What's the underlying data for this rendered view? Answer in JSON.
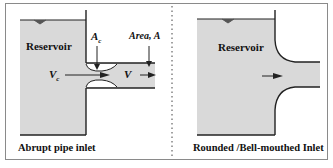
{
  "left_panel": {
    "reservoir_label": "Reservoir",
    "contraction_area_label": "A",
    "contraction_area_sub": "c",
    "pipe_area_label": "Area, A",
    "contraction_velocity_label": "V",
    "contraction_velocity_sub": "c",
    "pipe_velocity_label": "V",
    "caption": "Abrupt pipe inlet"
  },
  "right_panel": {
    "reservoir_label": "Reservoir",
    "caption": "Rounded /Bell-mouthed Inlet"
  },
  "colors": {
    "fluid": "#d9d9d9",
    "wall": "#222222",
    "border": "#8a8a8a"
  }
}
